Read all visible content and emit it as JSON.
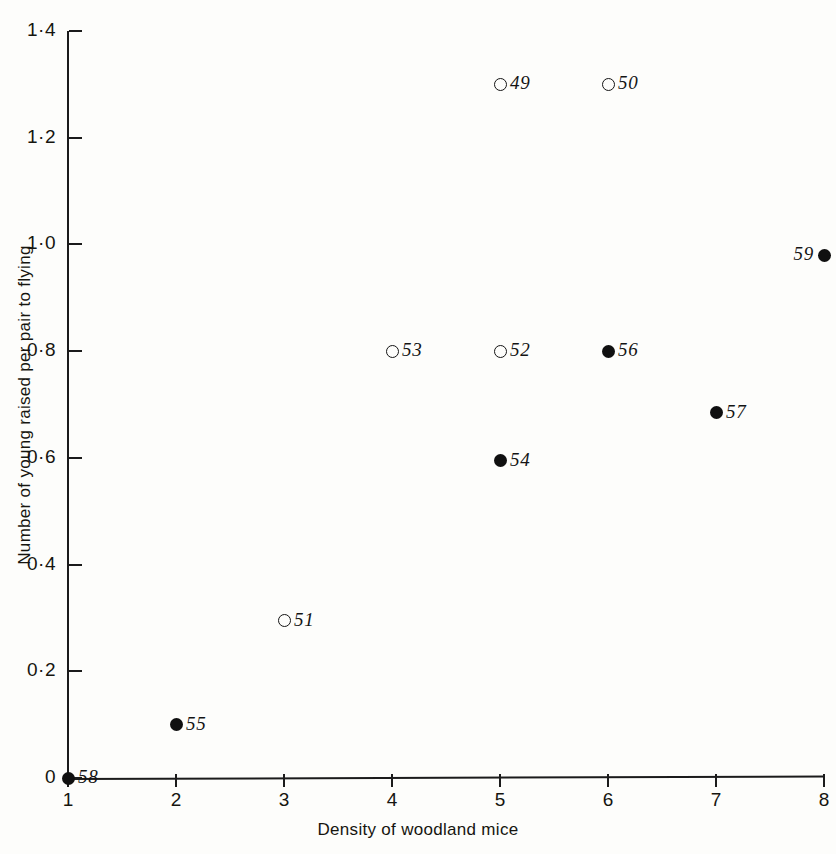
{
  "figure": {
    "title": "BARN OWLS AND OTHER PREDATORS"
  },
  "chart_data": {
    "type": "scatter",
    "title": "BARN OWLS AND OTHER PREDATORS",
    "xlabel": "Density of woodland mice",
    "ylabel": "Number of young raised per pair to flying",
    "xlim": [
      1,
      8
    ],
    "ylim": [
      0,
      1.4
    ],
    "grid": false,
    "legend": "none",
    "x_ticks": [
      "1",
      "2",
      "3",
      "4",
      "5",
      "6",
      "7",
      "8"
    ],
    "x_tick_values": [
      1,
      2,
      3,
      4,
      5,
      6,
      7,
      8
    ],
    "y_ticks": [
      "0",
      "0·2",
      "0·4",
      "0·6",
      "0·8",
      "1·0",
      "1·2",
      "1·4"
    ],
    "y_tick_values": [
      0,
      0.2,
      0.4,
      0.6,
      0.8,
      1.0,
      1.2,
      1.4
    ],
    "marker_styles": {
      "open": "open-circle",
      "filled": "filled-circle"
    },
    "points": [
      {
        "label": "49",
        "x": 5.0,
        "y": 1.3,
        "marker": "open",
        "label_side": "right"
      },
      {
        "label": "50",
        "x": 6.0,
        "y": 1.3,
        "marker": "open",
        "label_side": "right"
      },
      {
        "label": "59",
        "x": 8.0,
        "y": 0.98,
        "marker": "filled",
        "label_side": "left"
      },
      {
        "label": "53",
        "x": 4.0,
        "y": 0.8,
        "marker": "open",
        "label_side": "right"
      },
      {
        "label": "52",
        "x": 5.0,
        "y": 0.8,
        "marker": "open",
        "label_side": "right"
      },
      {
        "label": "56",
        "x": 6.0,
        "y": 0.8,
        "marker": "filled",
        "label_side": "right"
      },
      {
        "label": "57",
        "x": 7.0,
        "y": 0.685,
        "marker": "filled",
        "label_side": "right"
      },
      {
        "label": "54",
        "x": 5.0,
        "y": 0.595,
        "marker": "filled",
        "label_side": "right"
      },
      {
        "label": "51",
        "x": 3.0,
        "y": 0.295,
        "marker": "open",
        "label_side": "right"
      },
      {
        "label": "55",
        "x": 2.0,
        "y": 0.1,
        "marker": "filled",
        "label_side": "right"
      },
      {
        "label": "58",
        "x": 1.0,
        "y": 0.0,
        "marker": "filled",
        "label_side": "right"
      }
    ]
  }
}
